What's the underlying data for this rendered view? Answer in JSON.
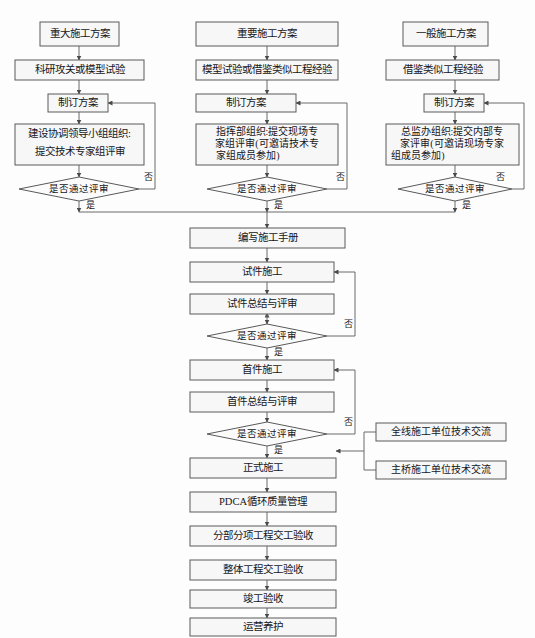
{
  "diagram": {
    "colors": {
      "box_fill": "#f7f7f7",
      "box_stroke": "#5a5a5a",
      "line": "#6a6a6a",
      "text": "#16161a",
      "background": "#fdfdfd"
    },
    "columns": [
      {
        "id": "col-major",
        "name": "重大施工方案流程",
        "nodes": [
          {
            "id": "n1",
            "type": "process",
            "label": "重大施工方案"
          },
          {
            "id": "n2",
            "type": "process",
            "label": "科研攻关或模型试验"
          },
          {
            "id": "n3",
            "type": "process",
            "label": "制订方案"
          },
          {
            "id": "n4",
            "type": "process",
            "label": "建设协调领导小组组织:\n提交技术专家组评审",
            "lines": [
              "建设协调领导小组组织:",
              "提交技术专家组评审"
            ]
          },
          {
            "id": "n5",
            "type": "decision",
            "label": "是否通过评审"
          }
        ]
      },
      {
        "id": "col-important",
        "name": "重要施工方案流程",
        "nodes": [
          {
            "id": "m1",
            "type": "process",
            "label": "重要施工方案"
          },
          {
            "id": "m2",
            "type": "process",
            "label": "模型试验或借鉴类似工程经验"
          },
          {
            "id": "m3",
            "type": "process",
            "label": "制订方案"
          },
          {
            "id": "m4",
            "type": "process",
            "label": "指挥部组织:提交现场专家组评审(可邀请技术专家组成员参加)",
            "lines": [
              "指挥部组织:提交现场专",
              "家组评审(可邀请技术专",
              "家组成员参加)"
            ]
          },
          {
            "id": "m5",
            "type": "decision",
            "label": "是否通过评审"
          }
        ]
      },
      {
        "id": "col-general",
        "name": "一般施工方案流程",
        "nodes": [
          {
            "id": "g1",
            "type": "process",
            "label": "一般施工方案"
          },
          {
            "id": "g2",
            "type": "process",
            "label": "借鉴类似工程经验"
          },
          {
            "id": "g3",
            "type": "process",
            "label": "制订方案"
          },
          {
            "id": "g4",
            "type": "process",
            "label": "总监办组织:提交内部专家评审(可邀请现场专家组成员参加)",
            "lines": [
              "总监办组织:提交内部专",
              "家评审(可邀请现场专家",
              "组成员参加)"
            ]
          },
          {
            "id": "g5",
            "type": "decision",
            "label": "是否通过评审"
          }
        ]
      }
    ],
    "trunk": [
      {
        "id": "t1",
        "type": "process",
        "label": "编写施工手册"
      },
      {
        "id": "t2",
        "type": "process",
        "label": "试件施工"
      },
      {
        "id": "t3",
        "type": "process",
        "label": "试件总结与评审"
      },
      {
        "id": "t4",
        "type": "decision",
        "label": "是否通过评审"
      },
      {
        "id": "t5",
        "type": "process",
        "label": "首件施工"
      },
      {
        "id": "t6",
        "type": "process",
        "label": "首件总结与评审"
      },
      {
        "id": "t7",
        "type": "decision",
        "label": "是否通过评审"
      },
      {
        "id": "t8",
        "type": "process",
        "label": "正式施工"
      },
      {
        "id": "t9",
        "type": "process",
        "label": "PDCA循环质量管理"
      },
      {
        "id": "t10",
        "type": "process",
        "label": "分部分项工程交工验收"
      },
      {
        "id": "t11",
        "type": "process",
        "label": "整体工程交工验收"
      },
      {
        "id": "t12",
        "type": "process",
        "label": "竣工验收"
      },
      {
        "id": "t13",
        "type": "process",
        "label": "运营养护"
      }
    ],
    "side_nodes": [
      {
        "id": "s1",
        "type": "process",
        "label": "全线施工单位技术交流"
      },
      {
        "id": "s2",
        "type": "process",
        "label": "主桥施工单位技术交流"
      }
    ],
    "edge_labels": {
      "yes": "是",
      "no": "否"
    },
    "edge_label_instances": [
      {
        "id": "el1",
        "text": "否",
        "near": "n5"
      },
      {
        "id": "el2",
        "text": "是",
        "near": "n5"
      },
      {
        "id": "el3",
        "text": "否",
        "near": "m5"
      },
      {
        "id": "el4",
        "text": "是",
        "near": "m5"
      },
      {
        "id": "el5",
        "text": "否",
        "near": "g5"
      },
      {
        "id": "el6",
        "text": "是",
        "near": "g5"
      },
      {
        "id": "el7",
        "text": "否",
        "near": "t4"
      },
      {
        "id": "el8",
        "text": "是",
        "near": "t4"
      },
      {
        "id": "el9",
        "text": "否",
        "near": "t7"
      },
      {
        "id": "el10",
        "text": "是",
        "near": "t7"
      }
    ]
  }
}
